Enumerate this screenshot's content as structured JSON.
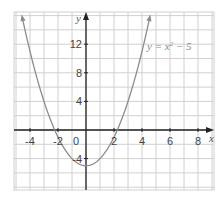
{
  "chart_data": {
    "type": "line",
    "title": "",
    "xlabel": "x",
    "ylabel": "y",
    "xlim": [
      -5,
      9
    ],
    "ylim": [
      -8,
      15
    ],
    "grid": true,
    "x_ticks": [
      -4,
      -2,
      0,
      2,
      4,
      6,
      8
    ],
    "y_ticks": [
      -4,
      4,
      8,
      12
    ],
    "x_tick_labels": [
      "-4",
      "-2",
      "0",
      "2",
      "4",
      "6",
      "8"
    ],
    "y_tick_labels": [
      "-4",
      "4",
      "8",
      "12"
    ],
    "series": [
      {
        "name": "y = x² − 5",
        "equation": "y = x^2 - 5",
        "x": [
          -4.5,
          -4,
          -3,
          -2,
          -1,
          0,
          1,
          2,
          3,
          4,
          4.5
        ],
        "values": [
          15.25,
          11,
          4,
          -1,
          -4,
          -5,
          -4,
          -1,
          4,
          11,
          15.25
        ],
        "color": "#8c8c8c"
      }
    ],
    "annotations": [
      {
        "text": "y = x² − 5",
        "x": 5.2,
        "y": 12
      }
    ]
  },
  "labels": {
    "x_axis": "x",
    "y_axis": "y",
    "equation_prefix": "y = x",
    "equation_sup": "2",
    "equation_suffix": " − 5",
    "origin": "0"
  },
  "colors": {
    "grid": "#d0d0d0",
    "axis": "#222222",
    "curve": "#8c8c8c",
    "text": "#444444"
  }
}
